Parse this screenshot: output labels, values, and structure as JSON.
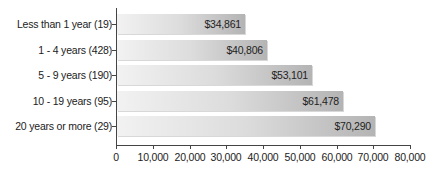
{
  "chart_data": {
    "type": "bar",
    "orientation": "horizontal",
    "title": "",
    "xlabel": "",
    "ylabel": "",
    "categories": [
      "Less than 1 year (19)",
      "1 - 4 years (428)",
      "5 - 9 years (190)",
      "10 - 19 years (95)",
      "20 years or more (29)"
    ],
    "values": [
      34861,
      40806,
      53101,
      61478,
      70290
    ],
    "value_labels": [
      "$34,861",
      "$40,806",
      "$53,101",
      "$61,478",
      "$70,290"
    ],
    "xlim": [
      0,
      80000
    ],
    "x_ticks": [
      0,
      10000,
      20000,
      30000,
      40000,
      50000,
      60000,
      70000,
      80000
    ],
    "x_tick_labels": [
      "0",
      "10,000",
      "20,000",
      "30,000",
      "40,000",
      "50,000",
      "60,000",
      "70,000",
      "80,000"
    ],
    "grid": false,
    "legend": null,
    "bar_color": "#c4c4c4"
  }
}
